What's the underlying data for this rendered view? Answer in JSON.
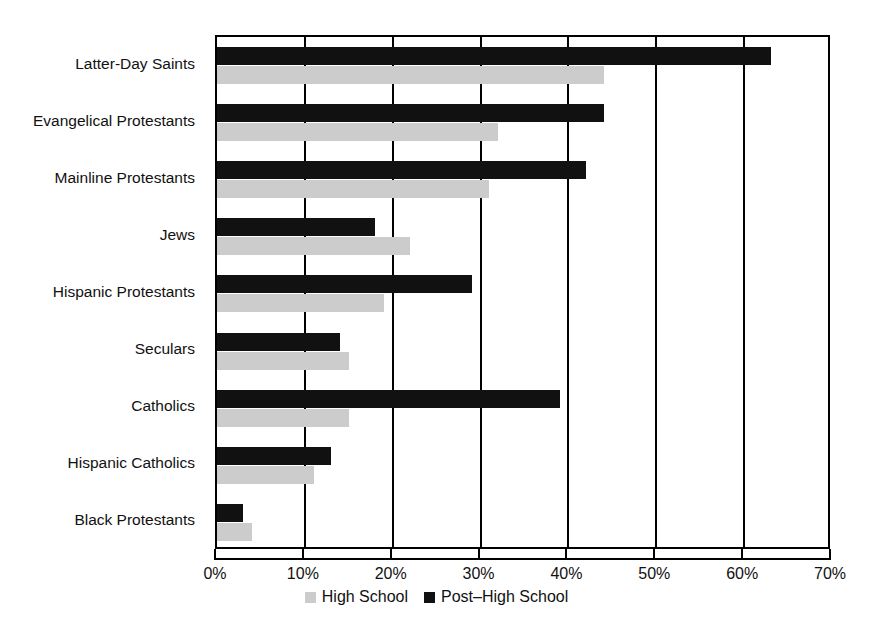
{
  "chart_data": {
    "type": "bar",
    "orientation": "horizontal",
    "title": "",
    "subtitle": "",
    "xlabel": "",
    "ylabel": "",
    "xlim": [
      0,
      70
    ],
    "xunit": "%",
    "grid": true,
    "legend_position": "bottom-center",
    "categories": [
      "Latter-Day Saints",
      "Evangelical Protestants",
      "Mainline Protestants",
      "Jews",
      "Hispanic Protestants",
      "Seculars",
      "Catholics",
      "Hispanic Catholics",
      "Black Protestants"
    ],
    "series": [
      {
        "name": "Post–High School",
        "color": "#111111",
        "values": [
          63,
          44,
          42,
          18,
          29,
          14,
          39,
          13,
          3
        ]
      },
      {
        "name": "High School",
        "color": "#cccccc",
        "values": [
          44,
          32,
          31,
          22,
          19,
          15,
          15,
          11,
          4
        ]
      }
    ],
    "xticks": [
      {
        "value": 0,
        "label": "0%"
      },
      {
        "value": 10,
        "label": "10%"
      },
      {
        "value": 20,
        "label": "20%"
      },
      {
        "value": 30,
        "label": "30%"
      },
      {
        "value": 40,
        "label": "40%"
      },
      {
        "value": 50,
        "label": "50%"
      },
      {
        "value": 60,
        "label": "60%"
      },
      {
        "value": 70,
        "label": "70%"
      }
    ]
  },
  "legend": {
    "items": [
      {
        "label": "High School",
        "swatch": "light-gray-square"
      },
      {
        "label": "Post–High School",
        "swatch": "black-square"
      }
    ]
  }
}
